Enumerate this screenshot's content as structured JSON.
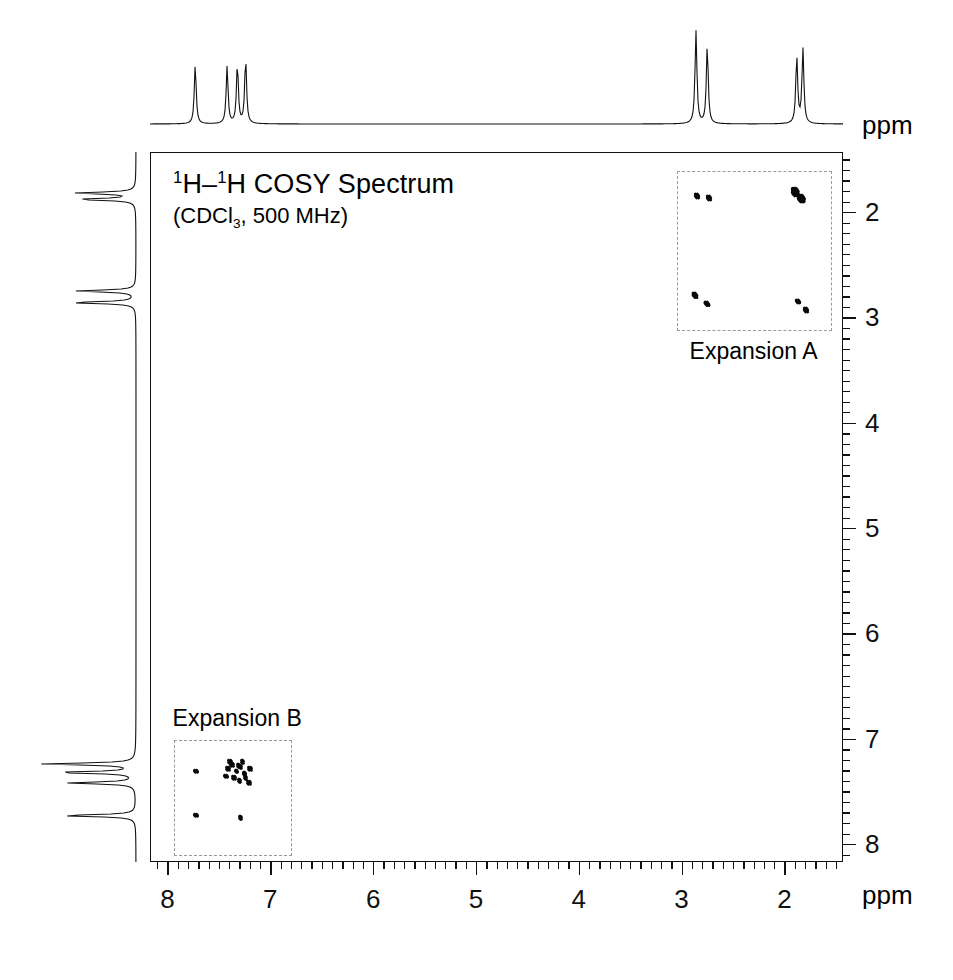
{
  "figure": {
    "title_html": "1H–1H COSY Spectrum",
    "title_nucleus": "H–",
    "conditions": "(CDCl3, 500 MHz)",
    "solvent": "CDCl",
    "solvent_sub": "3",
    "field": "500 MHz",
    "superscript": "1",
    "background": "#ffffff",
    "trace_color": "#111111",
    "peak_color": "#0a0a0a",
    "box_color": "#9a9a9a"
  },
  "axes": {
    "x_unit": "ppm",
    "y_unit": "ppm",
    "x_ticks": [
      "8",
      "7",
      "6",
      "5",
      "4",
      "3",
      "2"
    ],
    "y_ticks": [
      "2",
      "3",
      "4",
      "5",
      "6",
      "7",
      "8"
    ],
    "x_min_ppm": 1.43,
    "x_max_ppm": 8.17,
    "y_min_ppm": 1.43,
    "y_max_ppm": 8.17,
    "x_direction": "reversed",
    "y_direction": "reversed",
    "minor_ticks_per_major": 10
  },
  "expansions": [
    {
      "id": "A",
      "label": "Expansion A",
      "x_range_ppm": [
        3.05,
        1.55
      ],
      "y_range_ppm": [
        1.6,
        3.12
      ],
      "label_position": "below"
    },
    {
      "id": "B",
      "label": "Expansion B",
      "x_range_ppm": [
        7.95,
        6.8
      ],
      "y_range_ppm": [
        7.0,
        8.1
      ],
      "label_position": "above"
    }
  ],
  "chart_data": {
    "type": "scatter",
    "title": "1H–1H COSY Spectrum",
    "subtitle": "(CDCl3, 500 MHz)",
    "xlabel": "ppm",
    "ylabel": "ppm",
    "xlim": [
      8.17,
      1.43
    ],
    "ylim": [
      8.17,
      1.43
    ],
    "grid": false,
    "legend": "none",
    "projection_1d_top": {
      "description": "1H NMR projection along F2",
      "peaks_ppm": [
        7.73,
        7.42,
        7.32,
        7.24,
        2.86,
        2.75,
        1.88,
        1.82
      ],
      "heights_rel": [
        0.62,
        0.6,
        0.62,
        0.68,
        0.97,
        0.82,
        0.7,
        0.78
      ]
    },
    "projection_1d_left": {
      "description": "1H NMR projection along F1",
      "peaks_ppm": [
        1.88,
        1.82,
        2.86,
        2.75,
        7.73,
        7.42,
        7.32,
        7.24
      ],
      "heights_rel": [
        0.78,
        0.7,
        0.82,
        0.97,
        0.62,
        0.6,
        0.62,
        0.68
      ]
    },
    "diagonal_peaks_ppm": [
      1.85,
      2.8,
      7.28,
      7.73
    ],
    "cross_peaks": [
      {
        "f2": 2.86,
        "f1": 1.84,
        "group": "A",
        "size": 9
      },
      {
        "f2": 2.74,
        "f1": 1.86,
        "group": "A",
        "size": 9
      },
      {
        "f2": 1.9,
        "f1": 1.8,
        "group": "A",
        "size": 13
      },
      {
        "f2": 1.84,
        "f1": 1.86,
        "group": "A",
        "size": 13
      },
      {
        "f2": 2.88,
        "f1": 2.78,
        "group": "A",
        "size": 10
      },
      {
        "f2": 2.76,
        "f1": 2.86,
        "group": "A",
        "size": 10
      },
      {
        "f2": 1.88,
        "f1": 2.84,
        "group": "A",
        "size": 9
      },
      {
        "f2": 1.8,
        "f1": 2.92,
        "group": "A",
        "size": 9
      },
      {
        "f2": 7.73,
        "f1": 7.3,
        "group": "B",
        "size": 8
      },
      {
        "f2": 7.32,
        "f1": 7.25,
        "group": "B",
        "size": 8
      },
      {
        "f2": 7.26,
        "f1": 7.33,
        "group": "B",
        "size": 8
      },
      {
        "f2": 7.73,
        "f1": 7.72,
        "group": "B",
        "size": 8
      },
      {
        "f2": 7.3,
        "f1": 7.74,
        "group": "B",
        "size": 8
      }
    ]
  }
}
